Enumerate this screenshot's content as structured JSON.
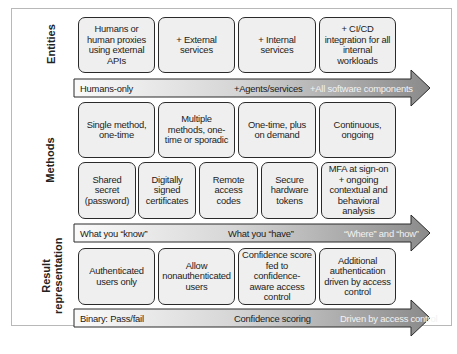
{
  "sections": {
    "entities": {
      "label": "Entities",
      "boxes": [
        "Humans or human proxies using external APIs",
        "+ External services",
        "+ Internal services",
        "+ CI/CD integration for all internal workloads"
      ],
      "arrow": {
        "start": "Humans-only",
        "middle": "+Agents/services",
        "end": "+All software components"
      }
    },
    "methods": {
      "label": "Methods",
      "frequency_boxes": [
        "Single method, one-time",
        "Multiple methods, one-time or sporadic",
        "One-time, plus on demand",
        "Continuous, ongoing"
      ],
      "type_boxes": [
        "Shared secret (password)",
        "Digitally signed certificates",
        "Remote access codes",
        "Secure hardware tokens",
        "MFA at sign-on + ongoing contextual and behavioral analysis"
      ],
      "arrow": {
        "start": "What you “know”",
        "middle": "What you “have”",
        "end": "“Where” and “how”"
      }
    },
    "result": {
      "label_line1": "Result",
      "label_line2": "representation",
      "boxes": [
        "Authenticated users only",
        "Allow nonauthenticated users",
        "Confidence score fed to confidence-aware access control",
        "Additional authentication driven by access control"
      ],
      "arrow": {
        "start": "Binary: Pass/fail",
        "middle": "Confidence scoring",
        "end": "Driven by access control"
      }
    }
  },
  "colors": {
    "box_fill": "#efefef",
    "box_border": "#2a2a2a",
    "arrow_gradient_start": "#fafafa",
    "arrow_gradient_end": "#8a8a8a"
  }
}
